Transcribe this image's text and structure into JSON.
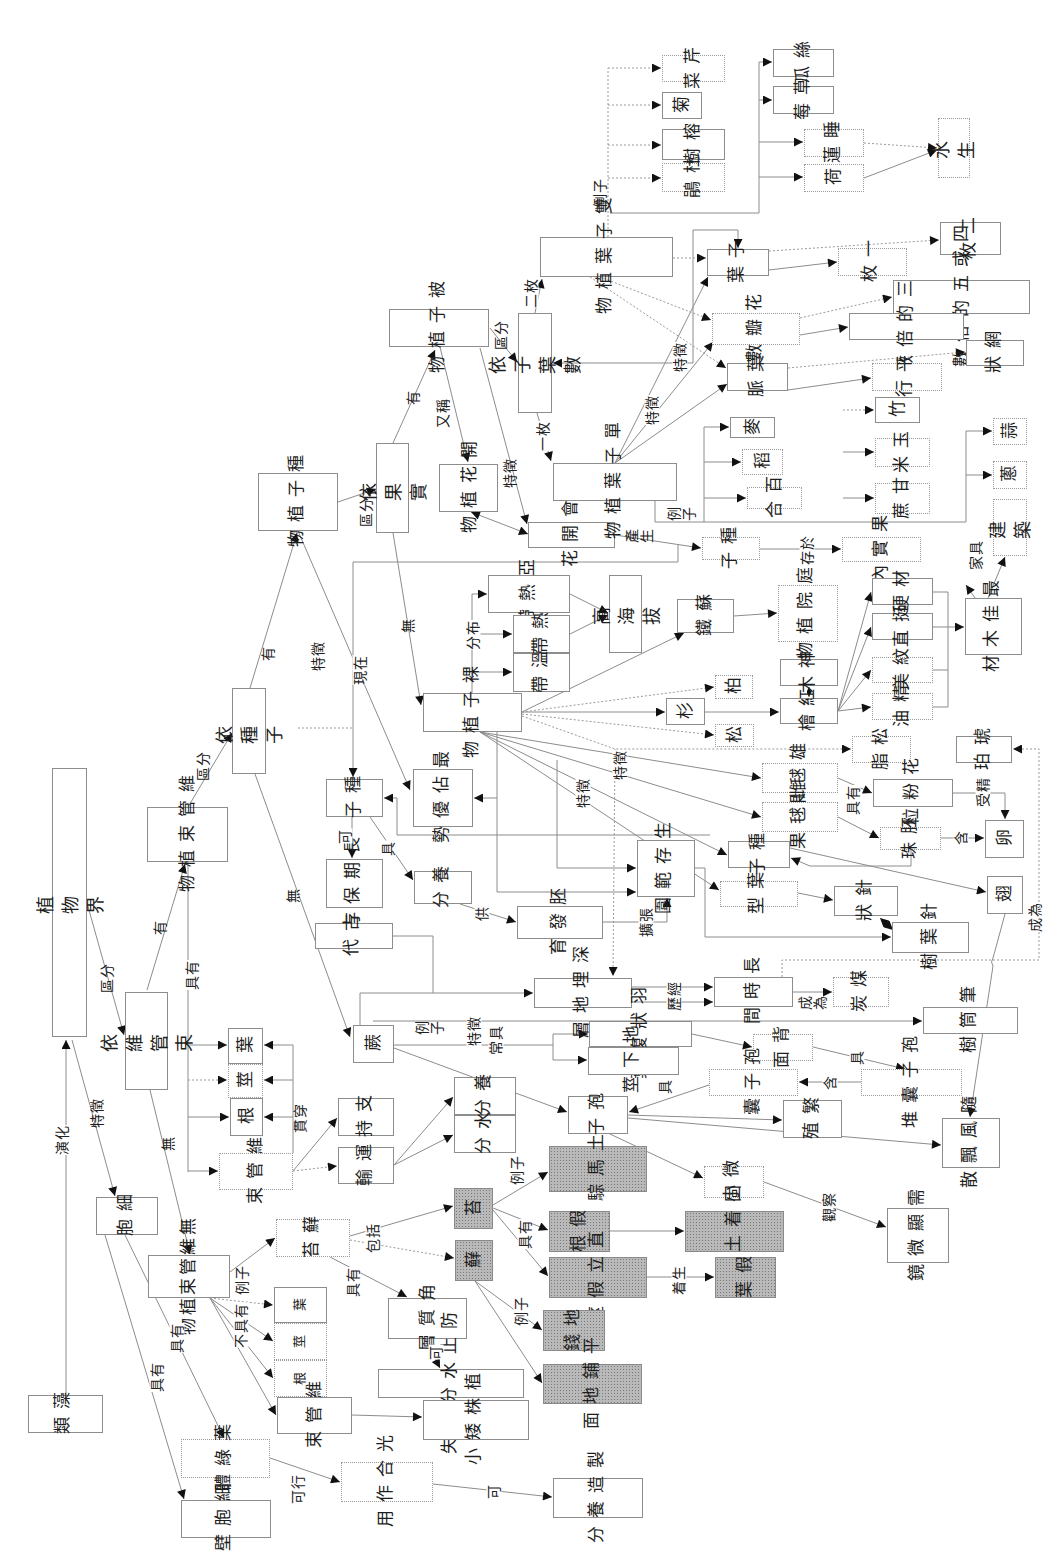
{
  "nodes": {
    "plant_kingdom": "植物界",
    "by_vascular": "依維管束",
    "vascular_plants": "維管束\n植物",
    "by_seed": "依種子",
    "seed_plants": "種子\n植物",
    "by_fruit": "依果實",
    "angiosperms": "被子植物",
    "by_cotyledon": "依子葉數",
    "flowering_plants": "開花\n植物",
    "can_flower": "會開花",
    "monocots": "單子葉植物",
    "dicots": "雙子葉植物",
    "cotyledon": "子葉",
    "petal_count": "花瓣數",
    "leaf_vein": "葉脈",
    "one_leaf": "一枚",
    "two_leaves": "二枚",
    "four_five": "四或五的倍數",
    "three_multiple": "三的倍數",
    "netted": "網狀",
    "parallel": "平行",
    "celery": "芹菜",
    "chrysanthemum": "菊",
    "banyan": "榕樹",
    "azalea": "杜鵑",
    "loofah": "絲瓜",
    "strawberry": "草莓",
    "water_lily": "睡蓮",
    "lotus": "荷",
    "aquatic": "水生",
    "bamboo": "竹",
    "wheat": "麥",
    "rice": "稻",
    "lily": "百合",
    "corn": "玉米",
    "sugarcane": "甘蔗",
    "garlic": "蒜",
    "scallion": "蔥",
    "construction": "建築",
    "seed_fruit": "種子",
    "in_fruit": "果實內",
    "gymnosperms": "裸子植物",
    "subtropical": "亞熱帶",
    "tropical": "熱帶",
    "temperate": "溫帶",
    "high_altitude": "高海拔",
    "cycad": "蘇鐵",
    "garden_plants": "庭院\n植物",
    "hard_wood": "材硬",
    "straight": "挺直",
    "fine_grain": "紋美",
    "essential_oil": "精油",
    "best_timber": "最佳\n木材",
    "sacred_tree": "神木",
    "red_cypress": "紅檜",
    "cypress": "柏",
    "fir": "杉",
    "pine": "松",
    "resin": "松脂",
    "amber": "琥珀",
    "male_cone": "雄毬果",
    "female_cone": "雌毬果",
    "pollen": "花粉粒",
    "ovule": "胚珠",
    "egg": "卵",
    "seed_gymno": "種子",
    "wing": "翅",
    "seed_main": "種子",
    "dominant": "最佔\n優勢",
    "long_storage": "長期\n保存",
    "nutrients_seed": "養分",
    "embryo_dev": "胚發育",
    "ancient": "古代",
    "buried": "深埋地層",
    "living_range": "生存\n範圍",
    "leaf_shape": "葉型",
    "needle": "針狀",
    "conifer": "針葉樹",
    "long_time": "長時間",
    "coal": "煤炭",
    "tree_fern": "筆筒樹",
    "fern": "蕨",
    "pinnate": "羽狀複葉",
    "rhizome": "地下莖",
    "underside": "背面",
    "sorus": "孢子囊堆",
    "sporangium": "孢子囊",
    "reproduce": "繁殖",
    "wind": "隨風\n飄散",
    "spore": "孢子",
    "tiny": "微小",
    "microscope": "需顯\n微鏡",
    "leaf_v": "葉",
    "stem_v": "莖",
    "root_v": "根",
    "bundle_v": "維管束",
    "support": "支持",
    "transport": "運輸",
    "nutrients_fern": "養分",
    "water": "水分",
    "liverwort": "苔",
    "moss": "蘚",
    "haircap": "土馬騌",
    "rhizoid": "假根",
    "anchor_soil": "固着土壤",
    "erect_stem": "直立假莖",
    "false_leaf": "假葉",
    "marchantia": "地錢",
    "flat_ground": "平鋪地面",
    "cell": "細胞",
    "nonvascular": "無維管\n束植物",
    "bryophytes": "蘚苔",
    "cuticle": "角質層",
    "prevent_loss": "防止水分喪失",
    "leaf_n": "葉",
    "stem_n": "莖",
    "root_n": "根",
    "bundle_n": "維管束",
    "small_plant": "植株矮小",
    "chloroplast": "葉綠體",
    "cell_wall": "細胞壁",
    "photosynthesis": "光合作用",
    "make_nutrients": "製造養分",
    "algae": "藻類"
  },
  "edge_labels": {
    "divide1": "區分",
    "feature1": "特徵",
    "evolve": "演化",
    "have1": "有",
    "possess1": "具有",
    "none1": "無",
    "divide2": "區分",
    "have2": "有",
    "none2": "無",
    "divide3": "區分",
    "have3": "有",
    "aka": "又稱",
    "none3": "無",
    "divide4": "區分",
    "two": "二枚",
    "one": "一枚",
    "feature2": "特徵",
    "produce": "產生",
    "stored": "存於",
    "example1": "例子",
    "example2": "例子",
    "feature3": "特徵",
    "feature4": "特徵",
    "furniture": "家具",
    "feature5": "特徵",
    "now": "現在",
    "distribute": "分布",
    "feature6": "特徵",
    "feature7": "特徵",
    "can1": "可",
    "have4": "具",
    "supply": "供",
    "expand": "擴張",
    "through": "歷經",
    "become1": "成為",
    "become2": "成為",
    "possess2": "具有",
    "fertilize": "受精",
    "contain1": "含",
    "example3": "例子",
    "feature8": "特徵",
    "often": "常具",
    "have5": "具",
    "contain2": "含",
    "have6": "具",
    "observe": "觀察",
    "pierce": "貫穿",
    "example4": "例子",
    "lack": "不具有",
    "include": "包括",
    "possess3": "具有",
    "can2": "可",
    "example5": "例子",
    "possess4": "具有",
    "grow_on": "着生",
    "example6": "例子",
    "possess5": "具有",
    "possess6": "具有",
    "can3": "可行",
    "can4": "可"
  },
  "colors": {
    "line": "#8c8c8c",
    "arrow": "#111111",
    "shaded_node": "#b9b9b9",
    "border": "#8d8d8d"
  }
}
